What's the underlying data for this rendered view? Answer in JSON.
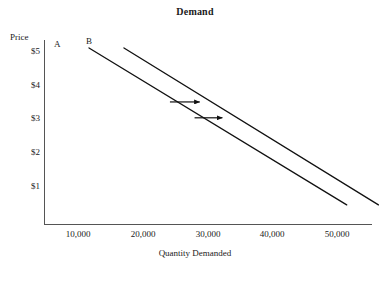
{
  "chart_data": {
    "type": "line",
    "title": "Demand",
    "xlabel": "Quantity Demanded",
    "ylabel": "Price",
    "xlim": [
      5000,
      55000
    ],
    "ylim": [
      0,
      5.6
    ],
    "grid": false,
    "legend": "none",
    "xticks": [
      "10,000",
      "20,000",
      "30,000",
      "40,000",
      "50,000"
    ],
    "xtick_values": [
      10000,
      20000,
      30000,
      40000,
      50000
    ],
    "yticks": [
      "$5",
      "$4",
      "$3",
      "$2",
      "$1"
    ],
    "ytick_values": [
      5,
      4,
      3,
      2,
      1
    ],
    "series": [
      {
        "name": "A",
        "label": "A",
        "points": [
          {
            "x": 11700,
            "y": 5.15
          },
          {
            "x": 51500,
            "y": 0.5
          }
        ]
      },
      {
        "name": "B",
        "label": "B",
        "points": [
          {
            "x": 17100,
            "y": 5.15
          },
          {
            "x": 56400,
            "y": 0.5
          }
        ]
      }
    ],
    "annotations": [
      {
        "type": "arrow",
        "name": "shift-arrow-upper",
        "direction": "right",
        "x_start": 24200,
        "x_end": 28800,
        "y": 3.55
      },
      {
        "type": "arrow",
        "name": "shift-arrow-lower",
        "direction": "right",
        "x_start": 28000,
        "x_end": 32300,
        "y": 3.08
      }
    ],
    "colors": {
      "line": "#111111",
      "axis": "#555555",
      "text": "#1a1a1a",
      "background": "#ffffff"
    }
  },
  "labels": {
    "title": "Demand",
    "y_axis_title": "Price",
    "x_axis_title": "Quantity Demanded",
    "curve_a": "A",
    "curve_b": "B",
    "ytick_1": "$5",
    "ytick_2": "$4",
    "ytick_3": "$3",
    "ytick_4": "$2",
    "ytick_5": "$1",
    "xtick_1": "10,000",
    "xtick_2": "20,000",
    "xtick_3": "30,000",
    "xtick_4": "40,000",
    "xtick_5": "50,000"
  }
}
